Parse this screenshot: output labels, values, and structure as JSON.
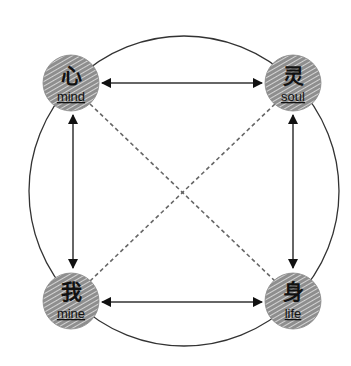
{
  "diagram": {
    "type": "relationship-diagram",
    "outer_circle": {
      "cx": 184,
      "cy": 191,
      "r": 155,
      "stroke": "#333333"
    },
    "nodes": [
      {
        "id": "mind",
        "cn": "心",
        "en": "mind",
        "cx": 71,
        "cy": 83
      },
      {
        "id": "soul",
        "cn": "灵",
        "en": "soul",
        "cx": 293,
        "cy": 83
      },
      {
        "id": "mine",
        "cn": "我",
        "en": "mine",
        "cx": 71,
        "cy": 301
      },
      {
        "id": "life",
        "cn": "身",
        "en": "life",
        "cx": 293,
        "cy": 301
      }
    ],
    "node_style": {
      "r": 28,
      "fill": "#9a9a9a",
      "hatch": "#e8e8e8"
    },
    "edges": [
      {
        "from": "mind",
        "to": "soul",
        "style": "solid",
        "bidirectional": true
      },
      {
        "from": "mind",
        "to": "mine",
        "style": "solid",
        "bidirectional": true
      },
      {
        "from": "soul",
        "to": "life",
        "style": "solid",
        "bidirectional": true
      },
      {
        "from": "mine",
        "to": "life",
        "style": "solid",
        "bidirectional": true
      },
      {
        "from": "mind",
        "to": "life",
        "style": "dashed",
        "bidirectional": false
      },
      {
        "from": "soul",
        "to": "mine",
        "style": "dashed",
        "bidirectional": false
      }
    ]
  }
}
